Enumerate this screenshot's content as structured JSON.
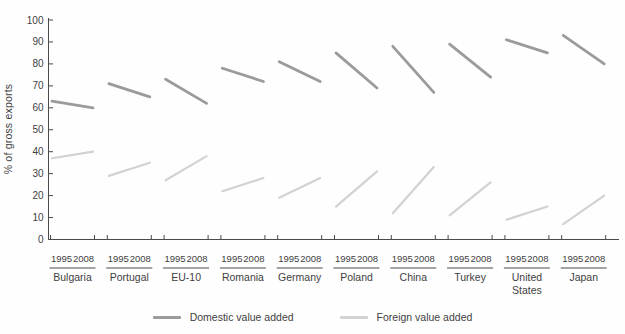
{
  "chart_data": {
    "type": "line",
    "subtype": "paired-slope",
    "title": "",
    "ylabel": "% of gross exports",
    "xlabel": "",
    "ylim": [
      0,
      100
    ],
    "yticks": [
      0,
      10,
      20,
      30,
      40,
      50,
      60,
      70,
      80,
      90,
      100
    ],
    "grid": false,
    "legend_position": "bottom",
    "years": [
      "1995",
      "2008"
    ],
    "categories": [
      "Bulgaria",
      "Portugal",
      "EU-10",
      "Romania",
      "Germany",
      "Poland",
      "China",
      "Turkey",
      "United States",
      "Japan"
    ],
    "series": [
      {
        "name": "Domestic value added",
        "color": "#9b9b9b",
        "values": [
          [
            63,
            60
          ],
          [
            71,
            65
          ],
          [
            73,
            62
          ],
          [
            78,
            72
          ],
          [
            81,
            72
          ],
          [
            85,
            69
          ],
          [
            88,
            67
          ],
          [
            89,
            74
          ],
          [
            91,
            85
          ],
          [
            93,
            80
          ]
        ]
      },
      {
        "name": "Foreign value added",
        "color": "#d2d2d2",
        "values": [
          [
            37,
            40
          ],
          [
            29,
            35
          ],
          [
            27,
            38
          ],
          [
            22,
            28
          ],
          [
            19,
            28
          ],
          [
            15,
            31
          ],
          [
            12,
            33
          ],
          [
            11,
            26
          ],
          [
            9,
            15
          ],
          [
            7,
            20
          ]
        ]
      }
    ],
    "colors": {
      "axis": "#4a4a4a",
      "text": "#3e3e3e"
    }
  }
}
